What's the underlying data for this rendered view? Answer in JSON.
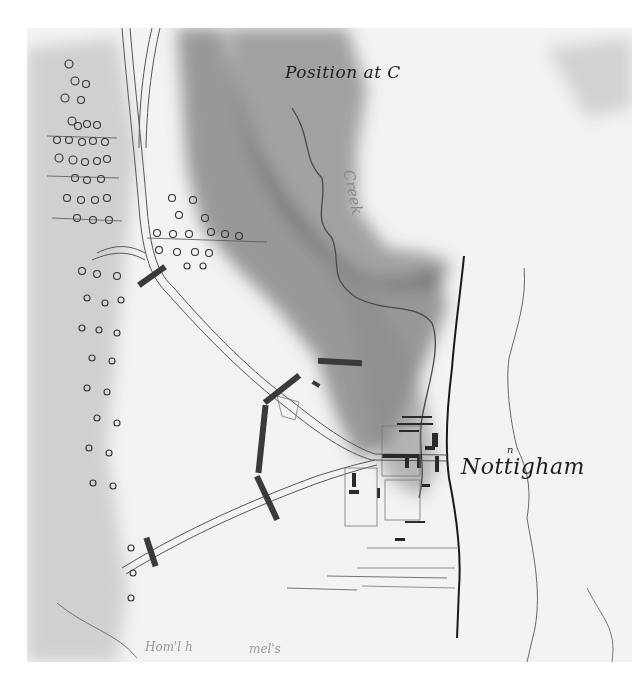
{
  "map": {
    "title": "Position at C",
    "town_name": "Nottigham",
    "town_name_superscript": "n",
    "creek_label": "Creek",
    "bottom_scrawls": [
      "Hom'l h",
      "mel's"
    ],
    "style": "hand-drawn pen and wash military sketch map",
    "colors": {
      "paper": "#f3f3f1",
      "ink": "#1e1e1e",
      "hill_shading": "#6e6e6e",
      "troop_blocks": "#3a3a3a"
    },
    "features": {
      "roads": [
        "north road descending from top-left hills",
        "road to Nottingham crossroads",
        "southwest road to lower-left"
      ],
      "streams": [
        "creek winding through shaded ridge",
        "river bank east of town",
        "eastern stream"
      ],
      "troop_positions": 8,
      "wooded_area": "tree symbols along western edge"
    }
  }
}
